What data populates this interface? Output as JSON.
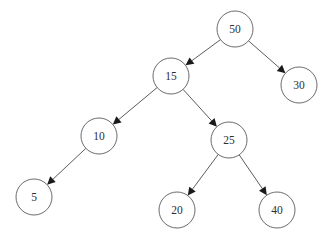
{
  "diagram": {
    "type": "binary-tree",
    "node_radius": 18,
    "colors": {
      "background": "#ffffff",
      "node_stroke": "#5a5a5a",
      "edge": "#4a4a4a",
      "arrow": "#1a1a1a",
      "text": "#2e2e2e"
    },
    "nodes": [
      {
        "id": "n50",
        "label": "50",
        "x": 235,
        "y": 29
      },
      {
        "id": "n15",
        "label": "15",
        "x": 171,
        "y": 76
      },
      {
        "id": "n30",
        "label": "30",
        "x": 299,
        "y": 85
      },
      {
        "id": "n10",
        "label": "10",
        "x": 99,
        "y": 136
      },
      {
        "id": "n25",
        "label": "25",
        "x": 229,
        "y": 140
      },
      {
        "id": "n5",
        "label": "5",
        "x": 34,
        "y": 197
      },
      {
        "id": "n20",
        "label": "20",
        "x": 177,
        "y": 210
      },
      {
        "id": "n40",
        "label": "40",
        "x": 277,
        "y": 210
      }
    ],
    "edges": [
      {
        "from": "n50",
        "to": "n15"
      },
      {
        "from": "n50",
        "to": "n30"
      },
      {
        "from": "n15",
        "to": "n10"
      },
      {
        "from": "n15",
        "to": "n25"
      },
      {
        "from": "n10",
        "to": "n5"
      },
      {
        "from": "n25",
        "to": "n20"
      },
      {
        "from": "n25",
        "to": "n40"
      }
    ]
  }
}
